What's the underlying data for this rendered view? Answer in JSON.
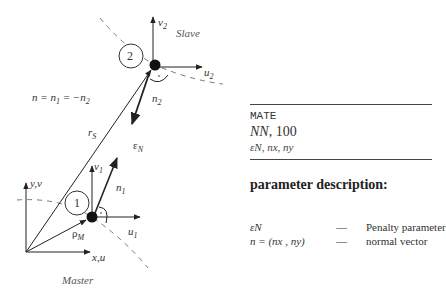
{
  "diagram": {
    "slave": {
      "label": "Slave",
      "node_number": "2",
      "u_label": "u",
      "u_sub": "2",
      "v_label": "v",
      "v_sub": "2",
      "n_label": "n",
      "n_sub": "2"
    },
    "master": {
      "label": "Master",
      "node_number": "1",
      "u_label": "u",
      "u_sub": "1",
      "v_label": "v",
      "v_sub": "1",
      "n_label": "n",
      "n_sub": "1"
    },
    "global_axes": {
      "x_label": "x,u",
      "y_label": "y,v"
    },
    "vectors": {
      "r_label": "r",
      "r_sub": "S",
      "rho_label": "ρ",
      "rho_sub": "M",
      "eps_label": "ε",
      "eps_sub": "N"
    },
    "equation": {
      "text_n": "n = n",
      "sub1": "1",
      "text_mid": " = −n",
      "sub2": "2"
    },
    "colors": {
      "line": "#333333",
      "dashed": "#777777",
      "node": "#111111"
    }
  },
  "command": {
    "keyword": "MATE",
    "line2_italic": "NN",
    "line2_value": ", 100",
    "line3": "εN, nx, ny"
  },
  "parameters": {
    "title": "parameter description:",
    "rows": [
      {
        "symbol": "εN",
        "dash": "—",
        "description": "Penalty parameter"
      },
      {
        "symbol": "n = (nx , ny)",
        "dash": "—",
        "description": "normal vector"
      }
    ]
  }
}
